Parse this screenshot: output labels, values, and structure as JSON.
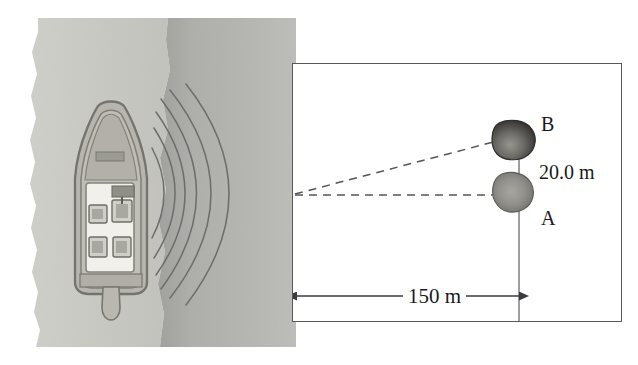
{
  "figure": {
    "scene": {
      "boat_label": "boat-top-view",
      "water_shallow_color": "#c8c8c4",
      "water_deep_color": "#a9a9a6",
      "wave_count": 6,
      "wave_color": "#6e6e70",
      "boat_hull_color": "#b4b2ab",
      "boat_outline_color": "#7b7a74",
      "boat_deck_color": "#f2f1ec"
    },
    "panel": {
      "border_color": "#59595c",
      "background": "#ffffff",
      "objects": [
        {
          "id": "B",
          "label": "B",
          "color": "#4e4d4c",
          "cx": 218,
          "cy": 78
        },
        {
          "id": "A",
          "label": "A",
          "color": "#8d8c88",
          "cx": 218,
          "cy": 131
        }
      ],
      "labels": {
        "object_b": "B",
        "object_a": "A",
        "vertical_separation": "20.0 m",
        "horizontal_distance": "150 m"
      },
      "dimensions": {
        "separation_value": 20.0,
        "separation_unit": "m",
        "distance_value": 150,
        "distance_unit": "m"
      },
      "ray_origin": {
        "x": 2,
        "y": 130
      },
      "dashed_line_color": "#55555a",
      "solid_line_color": "#55555a"
    }
  }
}
